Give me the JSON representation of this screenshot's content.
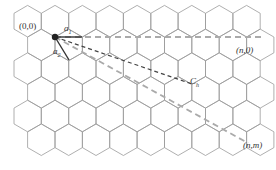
{
  "diagram": {
    "lattice": {
      "hex_size": 15.8,
      "origin_x": 55,
      "origin_y": 37,
      "line_color": "#9a9a9a"
    },
    "labels": {
      "origin": "(0,0)",
      "a1": "a",
      "a1_sub": "1",
      "a2": "a",
      "a2_sub": "2",
      "n0": "(n,0)",
      "ch": "C",
      "ch_sub": "h",
      "nm": "(n,m)"
    },
    "vectors": {
      "a1": {
        "from": [
          55,
          37
        ],
        "to": [
          82,
          37
        ],
        "color": "#333333"
      },
      "a2": {
        "from": [
          55,
          37
        ],
        "to": [
          69,
          60
        ],
        "color": "#333333"
      },
      "ch": {
        "from": [
          55,
          37
        ],
        "to": [
          192,
          84
        ],
        "color": "#444444"
      },
      "zigzag_axis": {
        "from": [
          55,
          37
        ],
        "to": [
          262,
          37
        ],
        "color": "#aaaaaa"
      },
      "armchair_axis": {
        "from": [
          55,
          37
        ],
        "to": [
          248,
          143
        ],
        "color": "#aaaaaa"
      }
    },
    "origin_point_color": "#222222"
  }
}
